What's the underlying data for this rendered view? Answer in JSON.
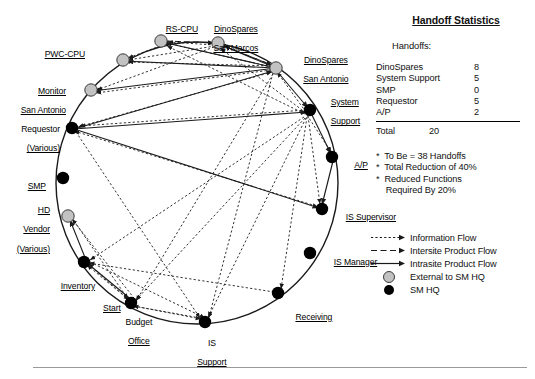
{
  "diagram": {
    "nodes": [
      {
        "id": "pwc-cpu",
        "label": "PWC-CPU",
        "type": "external",
        "x": 123,
        "y": 60,
        "label_x": 78,
        "label_y": 44,
        "align": "right",
        "lines": [
          "PWC-CPU"
        ]
      },
      {
        "id": "rs-cpu",
        "label": "RS-CPU",
        "type": "external",
        "x": 161,
        "y": 41,
        "label_x": 175,
        "label_y": 19,
        "align": "center",
        "lines": [
          "RS-CPU"
        ]
      },
      {
        "id": "dinospares-san-marcos",
        "label": "DinoSpares San Marcos",
        "type": "external",
        "x": 218,
        "y": 43,
        "label_x": 248,
        "label_y": 19,
        "align": "center",
        "lines": [
          "DinoSpares",
          "San Marcos"
        ]
      },
      {
        "id": "dinospares-san-antonio",
        "label": "DinoSpares San Antonio",
        "type": "external",
        "x": 276,
        "y": 68,
        "label_x": 330,
        "label_y": 50,
        "align": "center",
        "lines": [
          "DinoSpares",
          "San Antonio"
        ]
      },
      {
        "id": "monitor-san-antonio",
        "label": "Monitor San Antonio",
        "type": "external",
        "x": 91,
        "y": 90,
        "label_x": 68,
        "label_y": 80,
        "align": "right",
        "lines": [
          "Monitor",
          "San Antonio"
        ]
      },
      {
        "id": "system-support",
        "label": "System Support",
        "type": "hq",
        "x": 310,
        "y": 110,
        "label_x": 349,
        "label_y": 92,
        "align": "left",
        "lines": [
          "System",
          "Support"
        ]
      },
      {
        "id": "requestor",
        "label": "Requestor (Various)",
        "type": "hq",
        "x": 72,
        "y": 128,
        "label_x": 51,
        "label_y": 117,
        "align": "right",
        "lines": [
          "Requestor",
          "(Various)"
        ]
      },
      {
        "id": "ap",
        "label": "A/P",
        "type": "hq",
        "x": 332,
        "y": 157,
        "label_x": 363,
        "label_y": 152,
        "align": "left",
        "lines": [
          "A/P"
        ]
      },
      {
        "id": "smp",
        "label": "SMP",
        "type": "hq",
        "x": 63,
        "y": 178,
        "label_x": 45,
        "label_y": 172,
        "align": "right",
        "lines": [
          "SMP"
        ]
      },
      {
        "id": "hd-vendor",
        "label": "HD Vendor (Various)",
        "type": "external",
        "x": 68,
        "y": 216,
        "label_x": 45,
        "label_y": 198,
        "align": "right",
        "lines": [
          "HD",
          "Vendor",
          "(Various)"
        ]
      },
      {
        "id": "is-supervisor",
        "label": "IS Supervisor",
        "type": "hq",
        "x": 322,
        "y": 209,
        "label_x": 337,
        "label_y": 205,
        "align": "left",
        "lines": [
          "IS Supervisor"
        ]
      },
      {
        "id": "is-manager",
        "label": "IS Manager",
        "type": "hq",
        "x": 310,
        "y": 253,
        "label_x": 325,
        "label_y": 249,
        "align": "left",
        "lines": [
          "IS Manager"
        ]
      },
      {
        "id": "inventory",
        "label": "Inventory",
        "type": "hq",
        "x": 84,
        "y": 262,
        "label_x": 72,
        "label_y": 277,
        "align": "right",
        "lines": [
          "Inventory"
        ]
      },
      {
        "id": "receiving",
        "label": "Receiving",
        "type": "hq",
        "x": 278,
        "y": 293,
        "label_x": 307,
        "label_y": 307,
        "align": "center",
        "lines": [
          "Receiving"
        ]
      },
      {
        "id": "budget-office",
        "label": "Budget Office",
        "type": "hq",
        "x": 131,
        "y": 303,
        "label_x": 123,
        "label_y": 311,
        "align": "center",
        "lines": [
          "Budget",
          "Office"
        ],
        "extra_label": "Start",
        "extra_x": 105,
        "extra_y": 298
      },
      {
        "id": "is-support",
        "label": "IS Support",
        "type": "hq",
        "x": 205,
        "y": 322,
        "label_x": 204,
        "label_y": 331,
        "align": "center",
        "lines": [
          "IS",
          "Support"
        ]
      }
    ]
  },
  "stats": {
    "title": "Handoff Statistics",
    "handoffs_label": "Handoffs:",
    "rows": [
      {
        "name": "DinoSpares",
        "value": "8"
      },
      {
        "name": "System Support",
        "value": "5"
      },
      {
        "name": "SMP",
        "value": "0"
      },
      {
        "name": "Requestor",
        "value": "5"
      },
      {
        "name": "A/P",
        "value": "2"
      }
    ],
    "total_label": "Total",
    "total_value": "20",
    "notes": [
      "*  To Be = 38 Handoffs",
      "*  Total Reduction of 40%",
      "*  Reduced Functions",
      "    Required By 20%"
    ]
  },
  "legend": {
    "items": [
      {
        "symbol": "dotted-arrow",
        "label": "Information Flow"
      },
      {
        "symbol": "dashed-arrow",
        "label": "Intersite Product Flow"
      },
      {
        "symbol": "solid-arrow",
        "label": "Intrasite Product Flow"
      },
      {
        "symbol": "grey-circle",
        "label": "External to SM HQ"
      },
      {
        "symbol": "black-circle",
        "label": "SM HQ"
      }
    ]
  },
  "colors": {
    "external_node": "#c2c2c2",
    "hq_node": "#000000",
    "line": "#1a1a1a",
    "rule": "#9a9a9a"
  }
}
